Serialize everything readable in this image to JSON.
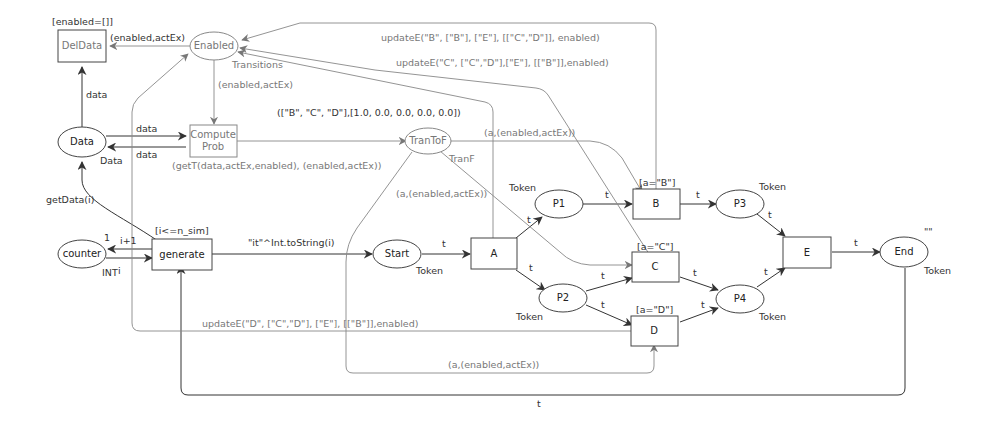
{
  "diagram": {
    "type": "colored-petri-net",
    "places": {
      "enabled": "Enabled",
      "data": "Data",
      "trantof": "TranToF",
      "counter": "counter",
      "start": "Start",
      "p1": "P1",
      "p2": "P2",
      "p3": "P3",
      "p4": "P4",
      "end": "End"
    },
    "transitions": {
      "deldata": "DelData",
      "compute_l1": "Compute",
      "compute_l2": "Prob",
      "generate": "generate",
      "a": "A",
      "b": "B",
      "c": "C",
      "d": "D",
      "e": "E"
    },
    "color_sets": {
      "enabled": "Transitions",
      "data": "Data",
      "trantof": "TranF",
      "counter": "INT",
      "start": "Token",
      "p1": "Token",
      "p2": "Token",
      "p3": "Token",
      "p4": "Token",
      "end": "Token"
    },
    "initial_markings": {
      "counter": "1",
      "end": "\"\""
    },
    "guards": {
      "deldata": "[enabled=[]]",
      "generate": "[i<=n_sim]",
      "b": "[a=\"B\"]",
      "c": "[a=\"C\"]",
      "d": "[a=\"D\"]"
    },
    "arc_labels": {
      "enabled_to_deldata": "(enabled,actEx)",
      "enabled_to_compute": "(enabled,actEx)",
      "data_to_deldata": "data",
      "data_to_compute": "data",
      "compute_to_data": "data",
      "compute_to_trantof": "(getT(data,actEx,enabled), (enabled,actEx))",
      "a_to_enabled": "([\"B\", \"C\", \"D\"],[1.0, 0.0, 0.0, 0.0, 0.0])",
      "b_to_enabled": "updateE(\"B\", [\"B\"], [\"E\"], [[\"C\",\"D\"]], enabled)",
      "c_to_enabled": "updateE(\"C\", [\"C\",\"D\"],[\"E\"], [[\"B\"]],enabled)",
      "d_to_enabled": "updateE(\"D\", [\"C\",\"D\"], [\"E\"], [[\"B\"]],enabled)",
      "trantof_to_b": "(a,(enabled,actEx))",
      "trantof_to_c": "(a,(enabled,actEx))",
      "trantof_to_d": "(a,(enabled,actEx))",
      "generate_to_data": "getData(i)",
      "generate_to_counter": "i+1",
      "counter_to_generate": "i",
      "generate_to_start": "\"it\"^Int.toString(i)",
      "start_to_a": "t",
      "a_to_p1": "t",
      "a_to_p2": "t",
      "p1_to_b": "t",
      "p2_to_c": "t",
      "p2_to_d": "t",
      "b_to_p3": "t",
      "c_to_p4": "t",
      "d_to_p4": "t",
      "p3_to_e": "t",
      "p4_to_e": "t",
      "e_to_end": "t",
      "end_to_generate": "t"
    }
  }
}
